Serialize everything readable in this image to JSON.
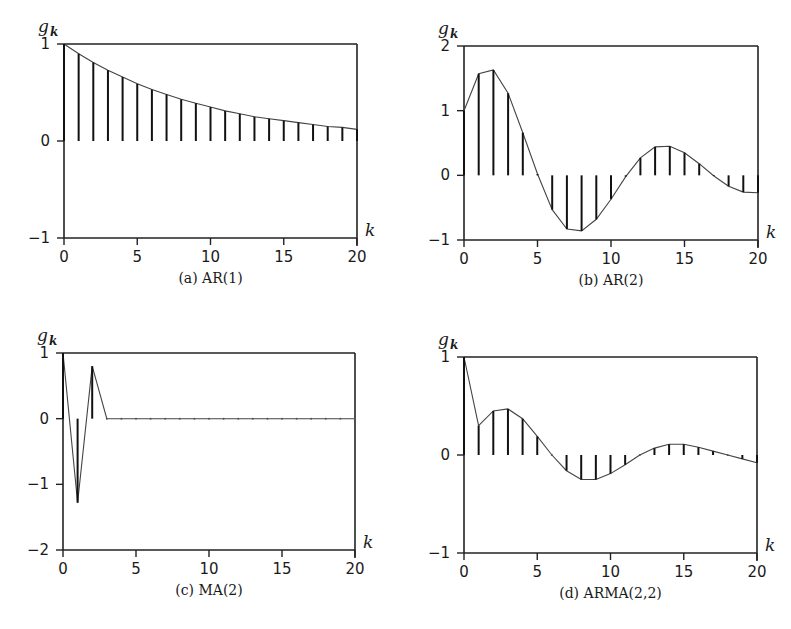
{
  "figure": {
    "panels": [
      {
        "id": "a",
        "caption": "(a) AR(1)",
        "ylabel": "g",
        "ylabel_sub": "k",
        "xlabel": "k"
      },
      {
        "id": "b",
        "caption": "(b) AR(2)",
        "ylabel": "g",
        "ylabel_sub": "k",
        "xlabel": "k"
      },
      {
        "id": "c",
        "caption": "(c) MA(2)",
        "ylabel": "g",
        "ylabel_sub": "k",
        "xlabel": "k"
      },
      {
        "id": "d",
        "caption": "(d) ARMA(2,2)",
        "ylabel": "g",
        "ylabel_sub": "k",
        "xlabel": "k"
      }
    ]
  },
  "chart_data": [
    {
      "type": "stem",
      "title": "(a) AR(1)",
      "xlabel": "k",
      "ylabel": "g_k",
      "xlim": [
        0,
        20
      ],
      "ylim": [
        -1,
        1
      ],
      "xticks": [
        0,
        5,
        10,
        15,
        20
      ],
      "yticks": [
        -1,
        0,
        1
      ],
      "grid": false,
      "x": [
        0,
        1,
        2,
        3,
        4,
        5,
        6,
        7,
        8,
        9,
        10,
        11,
        12,
        13,
        14,
        15,
        16,
        17,
        18,
        19,
        20
      ],
      "values": [
        1.0,
        0.9,
        0.81,
        0.73,
        0.66,
        0.59,
        0.53,
        0.48,
        0.43,
        0.39,
        0.35,
        0.31,
        0.28,
        0.25,
        0.23,
        0.21,
        0.19,
        0.17,
        0.15,
        0.14,
        0.12
      ]
    },
    {
      "type": "stem",
      "title": "(b) AR(2)",
      "xlabel": "k",
      "ylabel": "g_k",
      "xlim": [
        0,
        20
      ],
      "ylim": [
        -1,
        2
      ],
      "xticks": [
        0,
        5,
        10,
        15,
        20
      ],
      "yticks": [
        -1,
        0,
        1,
        2
      ],
      "grid": false,
      "x": [
        0,
        1,
        2,
        3,
        4,
        5,
        6,
        7,
        8,
        9,
        10,
        11,
        12,
        13,
        14,
        15,
        16,
        17,
        18,
        19,
        20
      ],
      "values": [
        1.0,
        1.57,
        1.63,
        1.27,
        0.66,
        0.02,
        -0.53,
        -0.83,
        -0.86,
        -0.68,
        -0.37,
        -0.02,
        0.27,
        0.44,
        0.45,
        0.35,
        0.18,
        -0.01,
        -0.17,
        -0.26,
        -0.27
      ]
    },
    {
      "type": "stem",
      "title": "(c) MA(2)",
      "xlabel": "k",
      "ylabel": "g_k",
      "xlim": [
        0,
        20
      ],
      "ylim": [
        -2,
        1
      ],
      "xticks": [
        0,
        5,
        10,
        15,
        20
      ],
      "yticks": [
        -2,
        -1,
        0,
        1
      ],
      "grid": false,
      "x": [
        0,
        1,
        2,
        3,
        4,
        5,
        6,
        7,
        8,
        9,
        10,
        11,
        12,
        13,
        14,
        15,
        16,
        17,
        18,
        19,
        20
      ],
      "values": [
        1.0,
        -1.28,
        0.8,
        0,
        0,
        0,
        0,
        0,
        0,
        0,
        0,
        0,
        0,
        0,
        0,
        0,
        0,
        0,
        0,
        0,
        0
      ]
    },
    {
      "type": "stem",
      "title": "(d) ARMA(2,2)",
      "xlabel": "k",
      "ylabel": "g_k",
      "xlim": [
        0,
        20
      ],
      "ylim": [
        -1,
        1
      ],
      "xticks": [
        0,
        5,
        10,
        15,
        20
      ],
      "yticks": [
        -1,
        0,
        1
      ],
      "grid": false,
      "x": [
        0,
        1,
        2,
        3,
        4,
        5,
        6,
        7,
        8,
        9,
        10,
        11,
        12,
        13,
        14,
        15,
        16,
        17,
        18,
        19,
        20
      ],
      "values": [
        1.0,
        0.3,
        0.45,
        0.47,
        0.37,
        0.19,
        0.0,
        -0.16,
        -0.25,
        -0.25,
        -0.19,
        -0.1,
        0.0,
        0.07,
        0.11,
        0.11,
        0.08,
        0.04,
        0.0,
        -0.04,
        -0.08
      ]
    }
  ]
}
